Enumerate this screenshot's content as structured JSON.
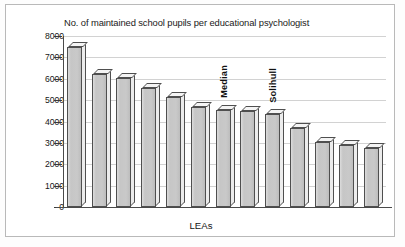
{
  "figure": {
    "xlabel_text": "LEAs"
  },
  "chart_data": {
    "type": "bar",
    "title": "No. of maintained school pupils per educational psychologist",
    "xlabel": "LEAs",
    "ylabel": "",
    "ylim": [
      0,
      8000
    ],
    "ytick_labels": [
      "8000",
      "7000",
      "6000",
      "5000",
      "4000",
      "3000",
      "2000",
      "1000",
      "0"
    ],
    "ytick_values": [
      8000,
      7000,
      6000,
      5000,
      4000,
      3000,
      2000,
      1000,
      0
    ],
    "grid": true,
    "legend": false,
    "categories": [
      "1",
      "2",
      "3",
      "4",
      "5",
      "6",
      "7",
      "8",
      "9",
      "10",
      "11",
      "12",
      "13"
    ],
    "values": [
      7480,
      6220,
      6050,
      5580,
      5150,
      4700,
      4550,
      4480,
      4330,
      3680,
      3030,
      2900,
      2780
    ],
    "bar_style": "3d",
    "bar_fill_color": "#c9c9c9",
    "bar_edge_color": "#4f4f4f",
    "gridline_color": "#d2d2d2",
    "annotations": [
      {
        "text": "Median",
        "bar_index": 6,
        "orientation": "vertical"
      },
      {
        "text": "Solihull",
        "bar_index": 8,
        "orientation": "vertical"
      }
    ]
  }
}
